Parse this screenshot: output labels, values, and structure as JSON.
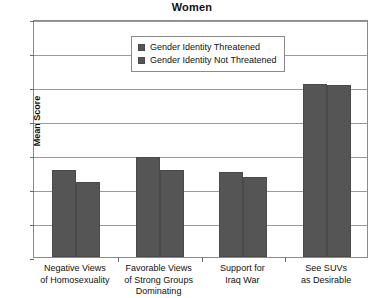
{
  "chart_data": {
    "type": "bar",
    "title": "Women",
    "xlabel": "",
    "ylabel": "Mean Score",
    "ylim": [
      0,
      7
    ],
    "yticks": [
      0,
      1,
      2,
      3,
      4,
      5,
      6,
      7
    ],
    "grid": true,
    "legend_position": "top-center",
    "categories": [
      "Negative Views of Homosexuality",
      "Favorable Views of Strong Groups Dominating",
      "Support for Iraq War",
      "See SUVs as Desirable"
    ],
    "category_lines": [
      [
        "Negative Views",
        "of Homosexuality"
      ],
      [
        "Favorable Views",
        "of Strong Groups",
        "Dominating"
      ],
      [
        "Support for",
        "Iraq War"
      ],
      [
        "See SUVs",
        "as Desirable"
      ]
    ],
    "series": [
      {
        "name": "Gender Identity Threatened",
        "color": "#555555",
        "values": [
          2.55,
          2.95,
          2.5,
          5.1
        ]
      },
      {
        "name": "Gender Identity Not Threatened",
        "color": "#555555",
        "values": [
          2.2,
          2.55,
          2.35,
          5.05
        ]
      }
    ]
  },
  "legend": {
    "items": [
      {
        "label": "Gender Identity Threatened"
      },
      {
        "label": "Gender Identity Not Threatened"
      }
    ]
  },
  "axis": {
    "y_label": "Mean Score",
    "y_ticks": [
      "7",
      "6",
      "5",
      "4",
      "3",
      "2",
      "1",
      "0"
    ]
  }
}
